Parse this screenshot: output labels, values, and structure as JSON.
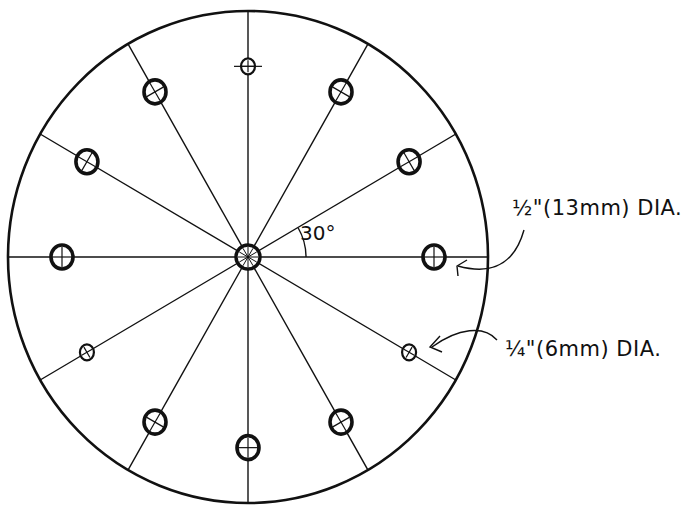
{
  "diagram": {
    "type": "hole-pattern-disc",
    "center": {
      "x": 248,
      "y": 257
    },
    "disc": {
      "rx": 240,
      "ry": 246
    },
    "radial_lines": {
      "count": 12,
      "spacing_deg": 30
    },
    "hole_circle_radius": 186,
    "holes": [
      {
        "angle_deg": 0,
        "size": "large",
        "mark": "plus"
      },
      {
        "angle_deg": 30,
        "size": "large",
        "mark": "x"
      },
      {
        "angle_deg": 60,
        "size": "large",
        "mark": "x"
      },
      {
        "angle_deg": 90,
        "size": "small",
        "mark": "plus"
      },
      {
        "angle_deg": 120,
        "size": "large",
        "mark": "x"
      },
      {
        "angle_deg": 150,
        "size": "large",
        "mark": "x"
      },
      {
        "angle_deg": 180,
        "size": "large",
        "mark": "plus"
      },
      {
        "angle_deg": 210,
        "size": "small",
        "mark": "x"
      },
      {
        "angle_deg": 240,
        "size": "large",
        "mark": "x"
      },
      {
        "angle_deg": 270,
        "size": "large",
        "mark": "plus"
      },
      {
        "angle_deg": 300,
        "size": "large",
        "mark": "x"
      },
      {
        "angle_deg": 330,
        "size": "small",
        "mark": "x"
      }
    ],
    "angle_annotation": "30°",
    "labels": {
      "large_hole": "½\"(13mm) DIA.",
      "small_hole": "¼\"(6mm) DIA."
    },
    "colors": {
      "ink": "#111111",
      "paper": "#ffffff"
    }
  }
}
